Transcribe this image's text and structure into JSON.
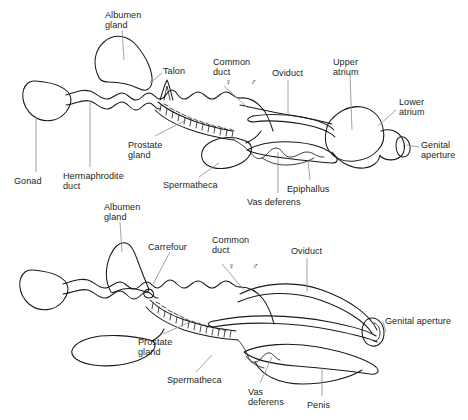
{
  "figure": {
    "background_color": "#ffffff",
    "outline_color": "#1a1a1a",
    "leader_line_color": "#8c8c8c",
    "text_color": "#231f20",
    "width": 468,
    "height": 420
  },
  "symbols": {
    "female": "♀",
    "male": "♂"
  },
  "upper_diagram": {
    "name": "upper-reproductive-system",
    "labels": [
      {
        "key": "albumen_gland",
        "text": "Albumen\ngland",
        "x": 105,
        "y": 10,
        "align": "left"
      },
      {
        "key": "talon",
        "text": "Talon",
        "x": 163,
        "y": 66,
        "align": "left"
      },
      {
        "key": "common_duct",
        "text": "Common\nduct",
        "x": 213,
        "y": 57,
        "align": "left"
      },
      {
        "key": "oviduct",
        "text": "Oviduct",
        "x": 272,
        "y": 68,
        "align": "left"
      },
      {
        "key": "upper_atrium",
        "text": "Upper\natrium",
        "x": 333,
        "y": 57,
        "align": "left"
      },
      {
        "key": "lower_atrium",
        "text": "Lower\natrium",
        "x": 399,
        "y": 97,
        "align": "left"
      },
      {
        "key": "genital_aperture",
        "text": "Genital\naperture",
        "x": 421,
        "y": 140,
        "align": "left"
      },
      {
        "key": "prostate_gland",
        "text": "Prostate\ngland",
        "x": 128,
        "y": 140,
        "align": "left"
      },
      {
        "key": "gonad",
        "text": "Gonad",
        "x": 14,
        "y": 176,
        "align": "left"
      },
      {
        "key": "hermaphrodite_duct",
        "text": "Hermaphrodite\nduct",
        "x": 63,
        "y": 171,
        "align": "left"
      },
      {
        "key": "spermatheca",
        "text": "Spermatheca",
        "x": 163,
        "y": 180,
        "align": "left"
      },
      {
        "key": "vas_deferens",
        "text": "Vas deferens",
        "x": 247,
        "y": 197,
        "align": "left"
      },
      {
        "key": "epiphallus",
        "text": "Epiphallus",
        "x": 287,
        "y": 184,
        "align": "left"
      }
    ],
    "sex_symbols": [
      {
        "key": "female-symbol-upper",
        "glyph": "♀",
        "x": 225,
        "y": 78
      },
      {
        "key": "male-symbol-upper",
        "glyph": "♂",
        "x": 250,
        "y": 78
      }
    ]
  },
  "lower_diagram": {
    "name": "lower-reproductive-system",
    "labels": [
      {
        "key": "albumen_gland",
        "text": "Albumen\ngland",
        "x": 104,
        "y": 202,
        "align": "left"
      },
      {
        "key": "carrefour",
        "text": "Carrefour",
        "x": 148,
        "y": 242,
        "align": "left"
      },
      {
        "key": "common_duct",
        "text": "Common\nduct",
        "x": 212,
        "y": 235,
        "align": "left"
      },
      {
        "key": "oviduct",
        "text": "Oviduct",
        "x": 291,
        "y": 246,
        "align": "left"
      },
      {
        "key": "genital_aperture",
        "text": "Genital aperture",
        "x": 385,
        "y": 316,
        "align": "left"
      },
      {
        "key": "prostate_gland",
        "text": "Prostate\ngland",
        "x": 138,
        "y": 337,
        "align": "left"
      },
      {
        "key": "spermatheca",
        "text": "Spermatheca",
        "x": 167,
        "y": 375,
        "align": "left"
      },
      {
        "key": "vas_deferens",
        "text": "Vas\ndeferens",
        "x": 248,
        "y": 387,
        "align": "left"
      },
      {
        "key": "penis",
        "text": "Penis",
        "x": 307,
        "y": 400,
        "align": "left"
      }
    ],
    "sex_symbols": [
      {
        "key": "female-symbol-lower",
        "glyph": "♀",
        "x": 228,
        "y": 262
      },
      {
        "key": "male-symbol-lower",
        "glyph": "♂",
        "x": 252,
        "y": 262
      }
    ]
  },
  "structures": {
    "upper": [
      "gonad",
      "hermaphrodite-duct",
      "albumen-gland",
      "talon",
      "prostate-gland",
      "common-duct",
      "spermatheca",
      "oviduct",
      "vas-deferens",
      "epiphallus",
      "upper-atrium",
      "lower-atrium",
      "genital-aperture"
    ],
    "lower": [
      "gonad",
      "hermaphrodite-duct",
      "albumen-gland",
      "carrefour",
      "prostate-gland",
      "common-duct",
      "spermatheca",
      "oviduct",
      "vas-deferens",
      "penis",
      "genital-aperture"
    ]
  }
}
